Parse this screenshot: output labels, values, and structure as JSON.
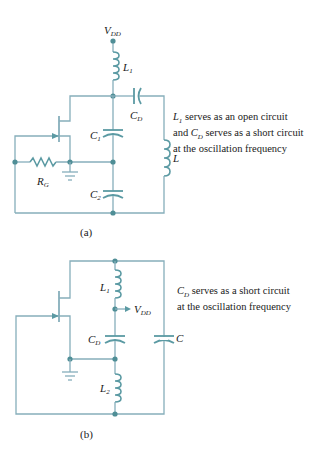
{
  "figure": {
    "panel_a": {
      "caption": "(a)",
      "labels": {
        "vdd": "V",
        "vdd_sub": "DD",
        "l1": "L",
        "l1_sub": "1",
        "cd": "C",
        "cd_sub": "D",
        "c1": "C",
        "c1_sub": "1",
        "c2": "C",
        "c2_sub": "2",
        "rg": "R",
        "rg_sub": "G",
        "l": "L"
      },
      "note_lines": [
        {
          "sym": "L",
          "sub": "1",
          "text": " serves as an open circuit"
        },
        {
          "pre": "and ",
          "sym": "C",
          "sub": "D",
          "text": " serves as a short circuit"
        },
        {
          "text": "at the oscillation frequency"
        }
      ]
    },
    "panel_b": {
      "caption": "(b)",
      "labels": {
        "l1": "L",
        "l1_sub": "1",
        "vdd": "V",
        "vdd_sub": "DD",
        "cd": "C",
        "cd_sub": "D",
        "c": "C",
        "l2": "L",
        "l2_sub": "2"
      },
      "note_lines": [
        {
          "sym": "C",
          "sub": "D",
          "text": " serves as a short circuit"
        },
        {
          "text": "at the oscillation frequency"
        }
      ]
    },
    "colors": {
      "wire": "#86aebb",
      "component": "#5b9aa3",
      "node": "#4f8e96",
      "text": "#1a1a1a"
    }
  }
}
